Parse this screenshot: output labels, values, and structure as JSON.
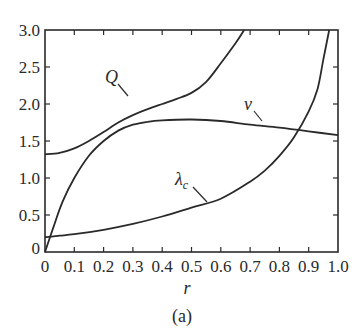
{
  "chart_data": {
    "type": "line",
    "title": "",
    "caption": "(a)",
    "xlabel": "r",
    "ylabel": "",
    "xlim": [
      0,
      1.0
    ],
    "ylim": [
      0,
      3.0
    ],
    "grid": false,
    "legend": "inline labels",
    "x_ticks": [
      "0",
      "0.1",
      "0.2",
      "0.3",
      "0.4",
      "0.5",
      "0.6",
      "0.7",
      "0.8",
      "0.9",
      "1.0"
    ],
    "y_ticks": [
      "0",
      "0.5",
      "1.0",
      "1.5",
      "2.0",
      "2.5",
      "3.0"
    ],
    "series": [
      {
        "name": "Q",
        "label": "Q",
        "x": [
          0,
          0.05,
          0.1,
          0.15,
          0.2,
          0.25,
          0.3,
          0.35,
          0.4,
          0.45,
          0.5,
          0.55,
          0.6,
          0.65,
          0.68
        ],
        "y": [
          1.32,
          1.34,
          1.4,
          1.5,
          1.62,
          1.75,
          1.85,
          1.93,
          2.0,
          2.07,
          2.15,
          2.3,
          2.55,
          2.82,
          3.0
        ]
      },
      {
        "name": "v",
        "label": "v",
        "x": [
          0,
          0.03,
          0.06,
          0.1,
          0.15,
          0.2,
          0.25,
          0.3,
          0.35,
          0.4,
          0.5,
          0.6,
          0.7,
          0.8,
          0.9,
          1.0
        ],
        "y": [
          0,
          0.35,
          0.68,
          1.0,
          1.3,
          1.5,
          1.64,
          1.72,
          1.76,
          1.78,
          1.79,
          1.77,
          1.72,
          1.68,
          1.63,
          1.58
        ]
      },
      {
        "name": "λc",
        "label": "λ",
        "label_sub": "c",
        "x": [
          0,
          0.05,
          0.1,
          0.2,
          0.3,
          0.4,
          0.5,
          0.6,
          0.7,
          0.75,
          0.8,
          0.85,
          0.9,
          0.93,
          0.95,
          0.97
        ],
        "y": [
          0.2,
          0.22,
          0.24,
          0.3,
          0.38,
          0.48,
          0.6,
          0.72,
          0.95,
          1.1,
          1.3,
          1.55,
          1.9,
          2.2,
          2.6,
          3.0
        ]
      }
    ]
  }
}
